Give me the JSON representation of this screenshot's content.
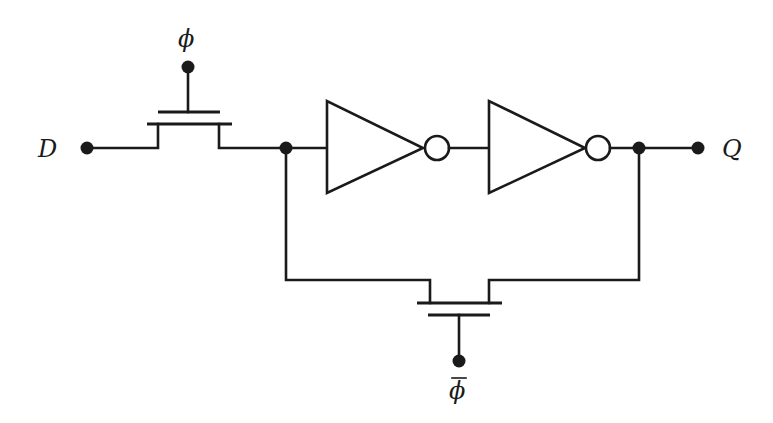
{
  "diagram": {
    "title": "",
    "type": "circuit-schematic",
    "labels": {
      "input": "D",
      "output": "Q",
      "clock": "ϕ",
      "clock_bar": "ϕ"
    },
    "components": [
      {
        "id": "pass-transistor-phi",
        "kind": "nmos-pass-transistor",
        "gate": "ϕ"
      },
      {
        "id": "inverter-1",
        "kind": "inverter"
      },
      {
        "id": "inverter-2",
        "kind": "inverter"
      },
      {
        "id": "pass-transistor-phi-bar",
        "kind": "nmos-pass-transistor",
        "gate": "ϕ̄ (phi-bar)"
      }
    ],
    "colors": {
      "stroke": "#1a1a1a",
      "background": "#ffffff"
    }
  }
}
